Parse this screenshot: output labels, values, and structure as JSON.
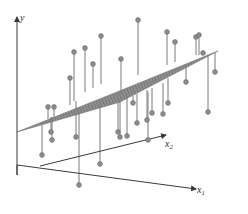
{
  "diagram": {
    "axes": {
      "y_label": "y",
      "x1_label": "x",
      "x1_sub": "1",
      "x2_label": "x",
      "x2_sub": "2"
    },
    "colors": {
      "axis": "#3a3a3a",
      "plane_fill": "#8a8a8a",
      "plane_hatch": "#5c5c5c",
      "stem": "#7a7a7a",
      "point": "#8c8c8c",
      "point_stroke": "#6a6a6a"
    },
    "caption": "",
    "plane": {
      "corners": [
        [
          17,
          132
        ],
        [
          112,
          94
        ],
        [
          218,
          51
        ],
        [
          120,
          102
        ]
      ]
    },
    "points": [
      {
        "x": 74,
        "y": 52,
        "base_y": 101
      },
      {
        "x": 85,
        "y": 48,
        "base_y": 92
      },
      {
        "x": 93,
        "y": 64,
        "base_y": 88
      },
      {
        "x": 101,
        "y": 36,
        "base_y": 84
      },
      {
        "x": 70,
        "y": 78,
        "base_y": 105
      },
      {
        "x": 121,
        "y": 59,
        "base_y": 94
      },
      {
        "x": 138,
        "y": 20,
        "base_y": 75
      },
      {
        "x": 167,
        "y": 32,
        "base_y": 65
      },
      {
        "x": 175,
        "y": 42,
        "base_y": 62
      },
      {
        "x": 196,
        "y": 37,
        "base_y": 55
      },
      {
        "x": 199,
        "y": 35,
        "base_y": 55
      },
      {
        "x": 203,
        "y": 53,
        "base_y": 53
      },
      {
        "x": 215,
        "y": 72,
        "base_y": 53
      },
      {
        "x": 48,
        "y": 107,
        "base_y": 119
      },
      {
        "x": 54,
        "y": 107,
        "base_y": 117
      },
      {
        "x": 51,
        "y": 132,
        "base_y": 117
      },
      {
        "x": 52,
        "y": 140,
        "base_y": 117
      },
      {
        "x": 42,
        "y": 155,
        "base_y": 125
      },
      {
        "x": 76,
        "y": 137,
        "base_y": 101
      },
      {
        "x": 100,
        "y": 164,
        "base_y": 104
      },
      {
        "x": 79,
        "y": 185,
        "base_y": 109
      },
      {
        "x": 120,
        "y": 137,
        "base_y": 100
      },
      {
        "x": 127,
        "y": 136,
        "base_y": 98
      },
      {
        "x": 137,
        "y": 123,
        "base_y": 94
      },
      {
        "x": 147,
        "y": 120,
        "base_y": 90
      },
      {
        "x": 148,
        "y": 140,
        "base_y": 92
      },
      {
        "x": 152,
        "y": 113,
        "base_y": 88
      },
      {
        "x": 163,
        "y": 114,
        "base_y": 83
      },
      {
        "x": 168,
        "y": 103,
        "base_y": 78
      },
      {
        "x": 186,
        "y": 82,
        "base_y": 67
      },
      {
        "x": 208,
        "y": 112,
        "base_y": 55
      },
      {
        "x": 133,
        "y": 103,
        "base_y": 96
      },
      {
        "x": 118,
        "y": 132,
        "base_y": 98
      }
    ]
  }
}
